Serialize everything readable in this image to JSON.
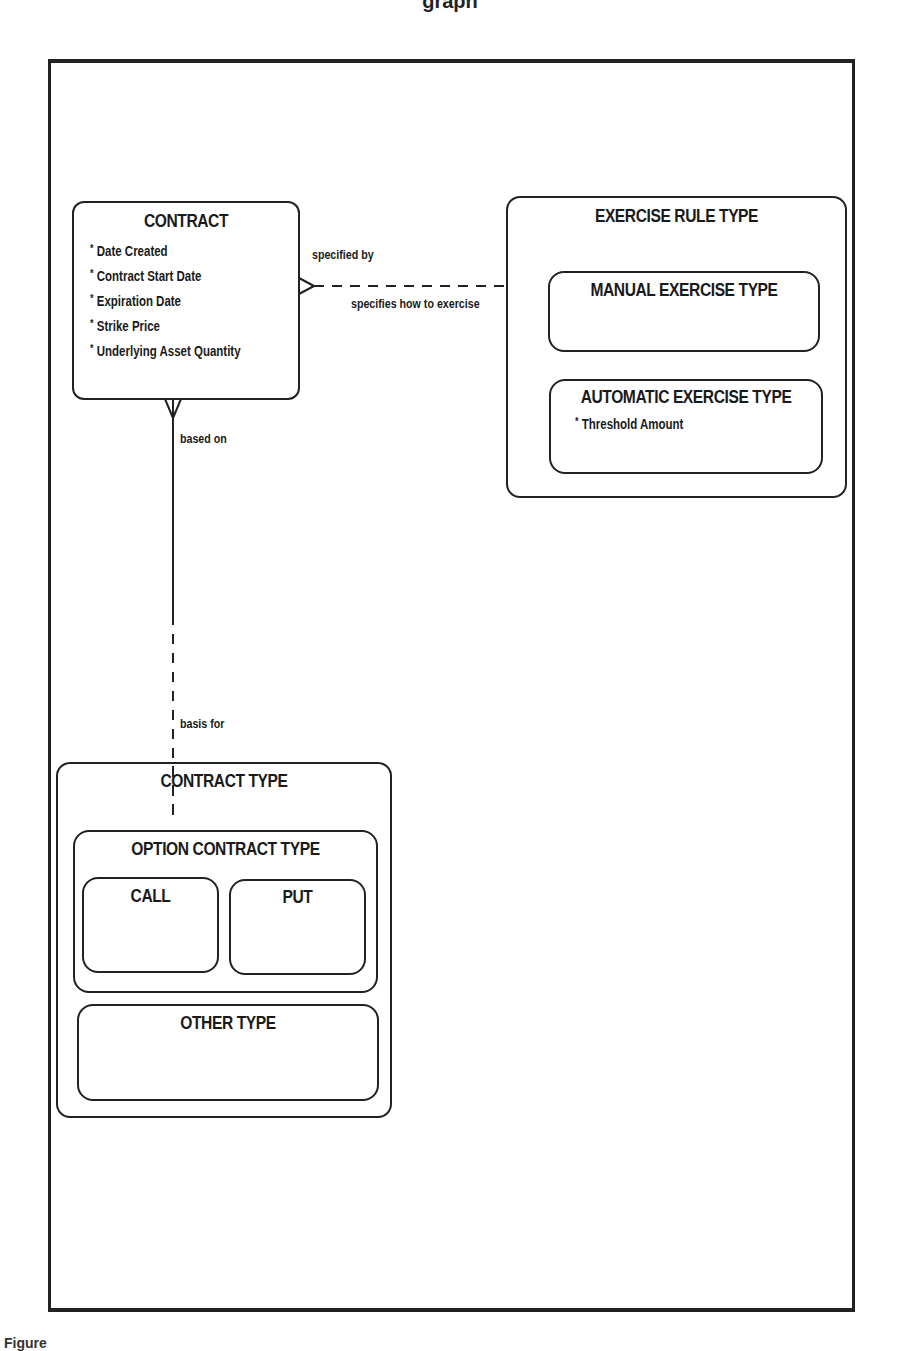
{
  "page": {
    "header_fragment": "graph",
    "caption_fragment": "Figure"
  },
  "entities": {
    "contract": {
      "title": "CONTRACT",
      "attributes": [
        "Date Created",
        "Contract Start Date",
        "Expiration Date",
        "Strike Price",
        "Underlying Asset Quantity"
      ]
    },
    "exercise_rule_type": {
      "title": "EXERCISE RULE TYPE",
      "subtypes": {
        "manual": {
          "title": "MANUAL EXERCISE TYPE",
          "attributes": []
        },
        "automatic": {
          "title": "AUTOMATIC EXERCISE TYPE",
          "attributes": [
            "Threshold Amount"
          ]
        }
      }
    },
    "contract_type": {
      "title": "CONTRACT TYPE",
      "subtypes": {
        "option": {
          "title": "OPTION CONTRACT TYPE",
          "subtypes": {
            "call": {
              "title": "CALL"
            },
            "put": {
              "title": "PUT"
            }
          }
        },
        "other": {
          "title": "OTHER TYPE"
        }
      }
    }
  },
  "relationships": {
    "contract_exercise": {
      "from_label": "specified by",
      "to_label": "specifies how to exercise",
      "from_cardinality": "many",
      "to_cardinality": "one",
      "from_optionality": "mandatory",
      "to_optionality": "optional"
    },
    "contract_contracttype": {
      "from_label": "based on",
      "to_label": "basis for",
      "from_cardinality": "many",
      "to_cardinality": "one",
      "from_optionality": "mandatory",
      "to_optionality": "optional"
    }
  },
  "attribute_marker": "*",
  "colors": {
    "line": "#222222",
    "background": "#ffffff",
    "text": "#1a1a1a"
  }
}
